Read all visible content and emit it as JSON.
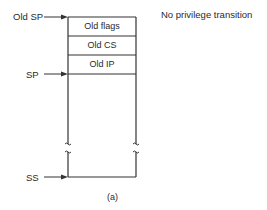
{
  "diagram": {
    "title": "No privilege transition",
    "caption": "(a)",
    "stack_cells": [
      {
        "label": "Old flags"
      },
      {
        "label": "Old CS"
      },
      {
        "label": "Old IP"
      }
    ],
    "pointers": {
      "old_sp": "Old SP",
      "sp": "SP",
      "ss": "SS"
    },
    "colors": {
      "line": "#333333",
      "text": "#2a2a2a",
      "background": "#ffffff"
    }
  }
}
